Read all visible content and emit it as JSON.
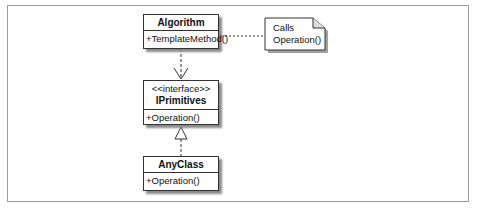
{
  "diagram": {
    "type": "uml-class",
    "classes": [
      {
        "id": "algorithm",
        "name": "Algorithm",
        "stereotype": null,
        "operations": [
          "+TemplateMethod()"
        ]
      },
      {
        "id": "iprimitives",
        "name": "IPrimitives",
        "stereotype": "<<interface>>",
        "operations": [
          "+Operation()"
        ]
      },
      {
        "id": "anyclass",
        "name": "AnyClass",
        "stereotype": null,
        "operations": [
          "+Operation()"
        ]
      }
    ],
    "note": {
      "lines": [
        "Calls",
        "Operation()"
      ],
      "attached_to": "algorithm"
    },
    "relations": [
      {
        "from": "algorithm",
        "to": "iprimitives",
        "kind": "dependency",
        "style": "dashed",
        "arrow": "open"
      },
      {
        "from": "anyclass",
        "to": "iprimitives",
        "kind": "realization",
        "style": "dashed",
        "arrow": "hollow-triangle"
      },
      {
        "from": "algorithm",
        "to": "note",
        "kind": "note-link",
        "style": "dashed",
        "arrow": "none"
      }
    ],
    "colors": {
      "line": "#333333",
      "frame": "#9a9a9a",
      "shadow": "#8a8a8a",
      "background": "#ffffff"
    }
  }
}
